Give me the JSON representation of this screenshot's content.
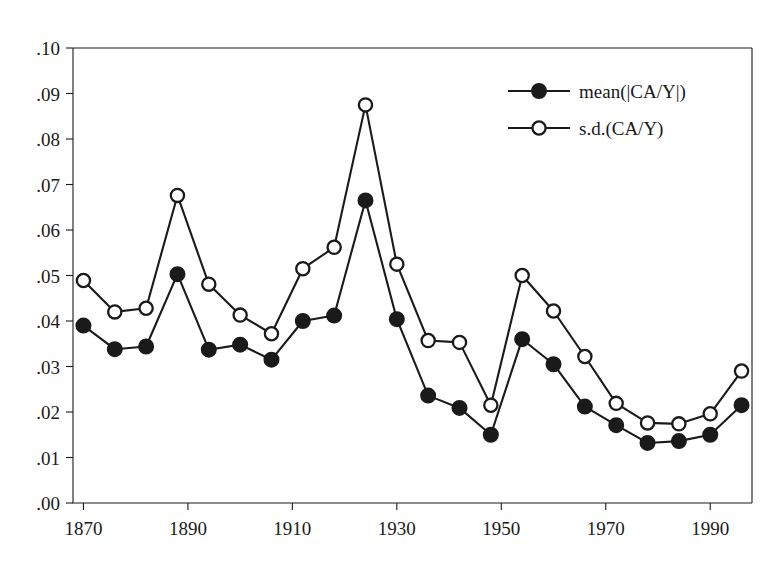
{
  "chart_data": {
    "type": "line",
    "title": "",
    "subtitle": "",
    "xlabel": "",
    "ylabel": "",
    "xlim": [
      1868,
      1998
    ],
    "ylim": [
      0.0,
      0.1
    ],
    "grid": false,
    "legend_position": "top-right",
    "x": [
      1870,
      1876,
      1882,
      1888,
      1894,
      1900,
      1906,
      1912,
      1918,
      1924,
      1930,
      1936,
      1942,
      1948,
      1954,
      1960,
      1966,
      1972,
      1978,
      1984,
      1990,
      1996
    ],
    "xticks": [
      1870,
      1890,
      1910,
      1930,
      1950,
      1970,
      1990
    ],
    "xticklabels": [
      "1870",
      "1890",
      "1910",
      "1930",
      "1950",
      "1970",
      "1990"
    ],
    "yticks": [
      0.0,
      0.01,
      0.02,
      0.03,
      0.04,
      0.05,
      0.06,
      0.07,
      0.08,
      0.09,
      0.1
    ],
    "yticklabels": [
      ".00",
      ".01",
      ".02",
      ".03",
      ".04",
      ".05",
      ".06",
      ".07",
      ".08",
      ".09",
      ".10"
    ],
    "series": [
      {
        "name": "mean(|CA/Y|)",
        "marker": "filled-circle",
        "color": "#1a1a1a",
        "values": [
          0.039,
          0.0338,
          0.0344,
          0.0503,
          0.0337,
          0.0348,
          0.0315,
          0.04,
          0.0412,
          0.0665,
          0.0404,
          0.0236,
          0.0209,
          0.015,
          0.036,
          0.0305,
          0.0212,
          0.0171,
          0.0132,
          0.0136,
          0.015,
          0.0215
        ]
      },
      {
        "name": "s.d.(CA/Y)",
        "marker": "open-circle",
        "color": "#1a1a1a",
        "values": [
          0.0489,
          0.042,
          0.0428,
          0.0676,
          0.0481,
          0.0413,
          0.0372,
          0.0515,
          0.0562,
          0.0875,
          0.0525,
          0.0357,
          0.0353,
          0.0215,
          0.05,
          0.0422,
          0.0322,
          0.0219,
          0.0176,
          0.0174,
          0.0196,
          0.029
        ]
      }
    ],
    "series_extra": {
      "note": "final segment continues past 1996",
      "x_tail": [
        2002,
        2008
      ],
      "mean_tail": [
        0.0195,
        0.0248
      ],
      "sd_tail": [
        0.0226,
        0.0282
      ]
    }
  },
  "legend": {
    "entries": [
      {
        "label": "mean(|CA/Y|)",
        "marker": "filled-circle"
      },
      {
        "label": "s.d.(CA/Y)",
        "marker": "open-circle"
      }
    ]
  },
  "axes": {
    "y_labels": [
      ".10",
      ".09",
      ".08",
      ".07",
      ".06",
      ".05",
      ".04",
      ".03",
      ".02",
      ".01",
      ".00"
    ],
    "x_labels": [
      "1870",
      "1890",
      "1910",
      "1930",
      "1950",
      "1970",
      "1990"
    ]
  }
}
